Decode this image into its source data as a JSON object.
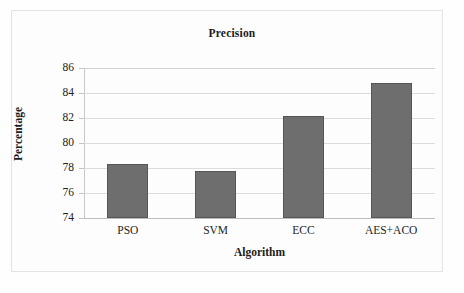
{
  "chart_data": {
    "type": "bar",
    "title": "Precision",
    "xlabel": "Algorithm",
    "ylabel": "Percentage",
    "categories": [
      "PSO",
      "SVM",
      "ECC",
      "AES+ACO"
    ],
    "values": [
      78.3,
      77.8,
      82.2,
      84.8
    ],
    "ylim": [
      74,
      86
    ],
    "ytick_step": 2,
    "yticks": [
      86,
      84,
      82,
      80,
      78,
      76,
      74
    ],
    "ytick_labels": [
      "86",
      "84",
      "82",
      "80",
      "78",
      "76",
      "74"
    ],
    "grid": true,
    "legend": false,
    "bar_color": "#6e6e6e",
    "bar_edge_color": "#565656",
    "gridline_color": "#dcdcdc",
    "background_color": "#fdfdfd",
    "border_color": "#e3e3e3"
  }
}
